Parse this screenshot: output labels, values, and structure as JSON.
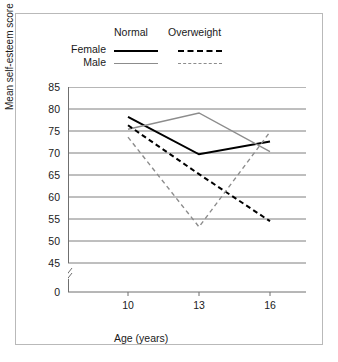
{
  "chart_data": {
    "type": "line",
    "title": "",
    "xlabel": "Age (years)",
    "ylabel": "Mean self-esteem score",
    "x": [
      10,
      13,
      16
    ],
    "categories": [
      "10",
      "13",
      "16"
    ],
    "xtick_labels": [
      "10",
      "13",
      "16"
    ],
    "ytick_labels": [
      "0",
      "45",
      "50",
      "55",
      "60",
      "65",
      "70",
      "75",
      "80",
      "85"
    ],
    "yticks": [
      0,
      45,
      50,
      55,
      60,
      65,
      70,
      75,
      80,
      85
    ],
    "ylim": [
      45,
      85
    ],
    "xlim": [
      10,
      16
    ],
    "axis_break": true,
    "axis_break_note": "y-axis broken between 0 and 45",
    "grid": "horizontal",
    "legend_position": "above-plot",
    "legend": {
      "column_headers": [
        "Normal",
        "Overweight"
      ],
      "row_headers": [
        "Female",
        "Male"
      ]
    },
    "series": [
      {
        "name": "Female Normal",
        "sex": "Female",
        "weight": "Normal",
        "style": "solid",
        "color": "#000000",
        "width": 2,
        "values": [
          78.2,
          69.7,
          72.6
        ]
      },
      {
        "name": "Male Normal",
        "sex": "Male",
        "weight": "Normal",
        "style": "solid",
        "color": "#8c8c8c",
        "width": 1.4,
        "values": [
          75.4,
          79.1,
          70.3
        ]
      },
      {
        "name": "Female Overweight",
        "sex": "Female",
        "weight": "Overweight",
        "style": "dashed",
        "color": "#000000",
        "width": 2,
        "values": [
          76.3,
          65.2,
          54.5
        ]
      },
      {
        "name": "Male Overweight",
        "sex": "Male",
        "weight": "Overweight",
        "style": "dashed",
        "color": "#8c8c8c",
        "width": 1.4,
        "values": [
          73.6,
          53.2,
          74.8
        ]
      }
    ]
  },
  "colors": {
    "female": "#000000",
    "male": "#8c8c8c",
    "grid": "#6f6f6f",
    "frame": "#b9b9b9",
    "background": "#ffffff"
  }
}
